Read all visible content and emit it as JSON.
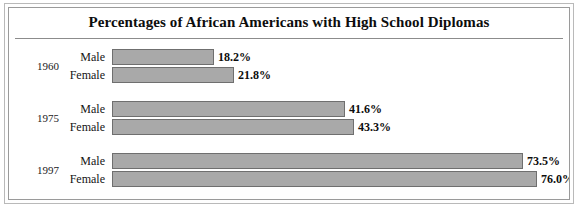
{
  "chart_data": {
    "type": "bar",
    "orientation": "horizontal",
    "title": "Percentages of African Americans with High School Diplomas",
    "xlabel": "",
    "ylabel": "",
    "grid": false,
    "legend": "none",
    "xlim": [
      0,
      80
    ],
    "categories": [
      "1960",
      "1975",
      "1997"
    ],
    "series": [
      {
        "name": "Male",
        "values": [
          18.2,
          41.6,
          73.5
        ]
      },
      {
        "name": "Female",
        "values": [
          21.8,
          43.3,
          76.0
        ]
      }
    ],
    "groups": [
      {
        "year": "1960",
        "rows": [
          {
            "label": "Male",
            "value": 18.2,
            "value_label": "18.2%"
          },
          {
            "label": "Female",
            "value": 21.8,
            "value_label": "21.8%"
          }
        ]
      },
      {
        "year": "1975",
        "rows": [
          {
            "label": "Male",
            "value": 41.6,
            "value_label": "41.6%"
          },
          {
            "label": "Female",
            "value": 43.3,
            "value_label": "43.3%"
          }
        ]
      },
      {
        "year": "1997",
        "rows": [
          {
            "label": "Male",
            "value": 73.5,
            "value_label": "73.5%"
          },
          {
            "label": "Female",
            "value": 76.0,
            "value_label": "76.0%"
          }
        ]
      }
    ],
    "colors": {
      "bar_fill": "#a9a9a9",
      "bar_border": "#6f6f6f",
      "text": "#0d0d0d",
      "frame": "#9a9a9a",
      "rule": "#8c8c8c"
    }
  }
}
